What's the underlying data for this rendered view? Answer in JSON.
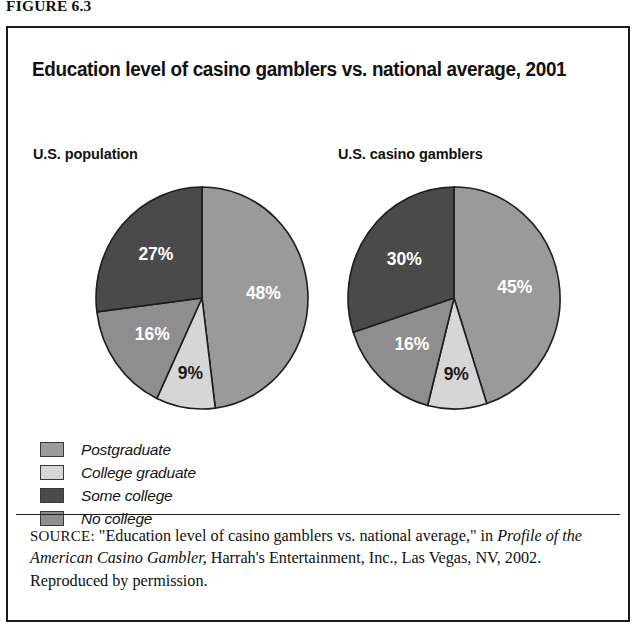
{
  "figure": {
    "label": "FIGURE 6.3"
  },
  "chart_title": "Education level of casino gamblers vs. national average, 2001",
  "panels": {
    "left_label": "U.S. population",
    "right_label": "U.S. casino gamblers"
  },
  "legend": {
    "items": [
      {
        "label": "Postgraduate",
        "color": "#9a9a9a"
      },
      {
        "label": "College graduate",
        "color": "#d6d6d6"
      },
      {
        "label": "Some college",
        "color": "#4a4a4a"
      },
      {
        "label": "No college",
        "color": "#8e8e8e"
      }
    ]
  },
  "source": {
    "prefix": "SOURCE:",
    "line1": " \"Education level of casino gamblers vs. national average,\" in ",
    "italic_title": "Profile of the American Casino Gambler,",
    "line2": " Harrah's Entertainment, Inc., Las Vegas, NV, 2002. Reproduced by permission."
  },
  "chart_data": {
    "type": "pie",
    "title": "Education level of casino gamblers vs. national average, 2001",
    "legend_position": "bottom-left",
    "categories": [
      "No college",
      "College graduate",
      "Postgraduate",
      "Some college"
    ],
    "colors": [
      "#9a9a9a",
      "#d6d6d6",
      "#8e8e8e",
      "#4a4a4a"
    ],
    "charts": [
      {
        "name": "U.S. population",
        "slices": [
          {
            "label": "No college",
            "value": 48,
            "display": "48%",
            "color": "#9a9a9a"
          },
          {
            "label": "College graduate",
            "value": 9,
            "display": "9%",
            "color": "#d6d6d6"
          },
          {
            "label": "Postgraduate",
            "value": 16,
            "display": "16%",
            "color": "#8e8e8e"
          },
          {
            "label": "Some college",
            "value": 27,
            "display": "27%",
            "color": "#4a4a4a"
          }
        ]
      },
      {
        "name": "U.S. casino gamblers",
        "slices": [
          {
            "label": "No college",
            "value": 45,
            "display": "45%",
            "color": "#9a9a9a"
          },
          {
            "label": "College graduate",
            "value": 9,
            "display": "9%",
            "color": "#d6d6d6"
          },
          {
            "label": "Postgraduate",
            "value": 16,
            "display": "16%",
            "color": "#8e8e8e"
          },
          {
            "label": "Some college",
            "value": 30,
            "display": "30%",
            "color": "#4a4a4a"
          }
        ]
      }
    ]
  }
}
